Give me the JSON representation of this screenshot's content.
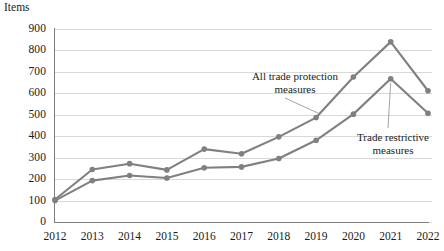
{
  "chart_data": {
    "type": "line",
    "title": "",
    "ylabel": "Items",
    "xlabel": "",
    "ylim": [
      0,
      900
    ],
    "ytick_step": 100,
    "grid": true,
    "legend_position": "inline-annotation",
    "categories": [
      "2012",
      "2013",
      "2014",
      "2015",
      "2016",
      "2017",
      "2018",
      "2019",
      "2020",
      "2021",
      "2022"
    ],
    "series": [
      {
        "name": "All trade protection measures",
        "color": "#808080",
        "values": [
          105,
          245,
          272,
          243,
          340,
          318,
          397,
          487,
          676,
          840,
          612
        ]
      },
      {
        "name": "Trade restrictive measures",
        "color": "#808080",
        "values": [
          100,
          193,
          217,
          205,
          253,
          257,
          296,
          381,
          503,
          668,
          507
        ]
      }
    ],
    "ytick_labels": [
      "0",
      "100",
      "200",
      "300",
      "400",
      "500",
      "600",
      "700",
      "800",
      "900"
    ],
    "annotations": [
      {
        "name": "all-trade-protection",
        "text": "All trade protection\nmeasures",
        "points_to_year": "2019"
      },
      {
        "name": "trade-restrictive",
        "text": "Trade restrictive\nmeasures",
        "points_to_year": "2021"
      }
    ]
  },
  "axis": {
    "y_title": "Items"
  },
  "colors": {
    "series_line": "#808080",
    "gridline": "#d8d8d8",
    "axis": "#7f7f7f",
    "text": "#1a1a1a",
    "leader": "#9a9a9a"
  }
}
